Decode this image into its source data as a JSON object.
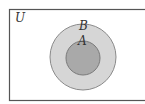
{
  "diagram": {
    "type": "venn",
    "universe": {
      "label": "U",
      "fill": "#ffffff",
      "stroke": "#555555"
    },
    "sets": [
      {
        "label": "B",
        "fill": "#d6d6d6",
        "stroke": "#8a8a8a"
      },
      {
        "label": "A",
        "fill": "#a9a9a9",
        "stroke": "#7a7a7a"
      }
    ]
  }
}
